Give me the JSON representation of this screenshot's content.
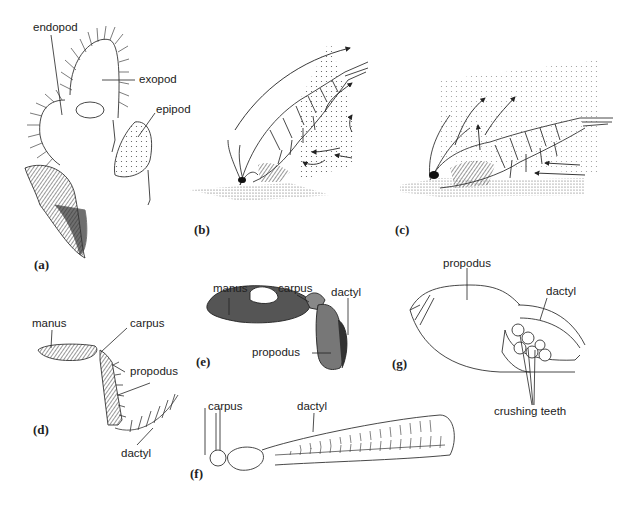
{
  "figure": {
    "panels": [
      {
        "id": "a",
        "marker": "(a)",
        "labels": [
          "endopod",
          "exopod",
          "epipod"
        ]
      },
      {
        "id": "b",
        "marker": "(b)",
        "labels": []
      },
      {
        "id": "c",
        "marker": "(c)",
        "labels": []
      },
      {
        "id": "d",
        "marker": "(d)",
        "labels": [
          "manus",
          "carpus",
          "propodus",
          "dactyl"
        ]
      },
      {
        "id": "e",
        "marker": "(e)",
        "labels": [
          "manus",
          "carpus",
          "dactyl",
          "propodus"
        ]
      },
      {
        "id": "f",
        "marker": "(f)",
        "labels": [
          "carpus",
          "dactyl"
        ]
      },
      {
        "id": "g",
        "marker": "(g)",
        "labels": [
          "propodus",
          "dactyl",
          "crushing teeth"
        ]
      }
    ]
  },
  "labels": {
    "a": {
      "endopod": "endopod",
      "exopod": "exopod",
      "epipod": "epipod"
    },
    "d": {
      "manus": "manus",
      "carpus": "carpus",
      "propodus": "propodus",
      "dactyl": "dactyl"
    },
    "e": {
      "manus": "manus",
      "carpus": "carpus",
      "dactyl": "dactyl",
      "propodus": "propodus"
    },
    "f": {
      "carpus": "carpus",
      "dactyl": "dactyl"
    },
    "g": {
      "propodus": "propodus",
      "dactyl": "dactyl",
      "crushing_teeth": "crushing teeth"
    }
  },
  "markers": {
    "a": "(a)",
    "b": "(b)",
    "c": "(c)",
    "d": "(d)",
    "e": "(e)",
    "f": "(f)",
    "g": "(g)"
  },
  "colors": {
    "ink": "#222222",
    "stipple": "#555555",
    "background": "#ffffff"
  }
}
